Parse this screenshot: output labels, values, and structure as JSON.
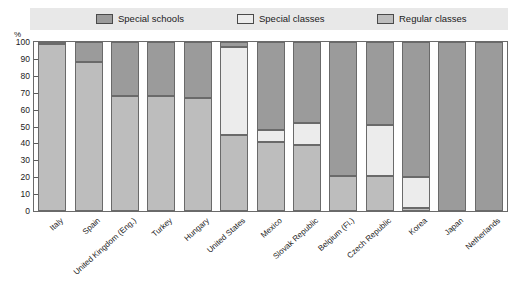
{
  "legend": {
    "position": "top",
    "entries": [
      {
        "label": "Special schools",
        "color": "#9b9b9b",
        "name": "legend-special-schools"
      },
      {
        "label": "Special classes",
        "color": "#ececec",
        "name": "legend-special-classes"
      },
      {
        "label": "Regular classes",
        "color": "#bdbdbd",
        "name": "legend-regular-classes"
      }
    ]
  },
  "axes": {
    "y_unit": "%",
    "y_ticks": [
      "100",
      "90",
      "80",
      "70",
      "60",
      "50",
      "40",
      "30",
      "20",
      "10",
      "0"
    ]
  },
  "chart_data": {
    "type": "bar",
    "title": "",
    "subtitle": "",
    "xlabel": "",
    "ylabel": "%",
    "ylim": [
      0,
      100
    ],
    "grid": false,
    "stacked": true,
    "legend_position": "top",
    "categories": [
      "Italy",
      "Spain",
      "United Kingdom (Eng.)",
      "Turkey",
      "Hungary",
      "United States",
      "Mexico",
      "Slovak Republic",
      "Belgium (Fl.)",
      "Czech Republic",
      "Korea",
      "Japan",
      "Netherlands"
    ],
    "series": [
      {
        "name": "Special schools",
        "color": "#9b9b9b",
        "values": [
          1,
          12,
          32,
          32,
          33,
          3,
          52,
          48,
          79,
          49,
          80,
          100,
          100
        ]
      },
      {
        "name": "Special classes",
        "color": "#ececec",
        "values": [
          0,
          0,
          0,
          0,
          0,
          52,
          7,
          13,
          0,
          30,
          18,
          0,
          0
        ]
      },
      {
        "name": "Regular classes",
        "color": "#bdbdbd",
        "values": [
          99,
          88,
          68,
          68,
          67,
          45,
          41,
          39,
          21,
          21,
          2,
          0,
          0
        ]
      }
    ]
  }
}
